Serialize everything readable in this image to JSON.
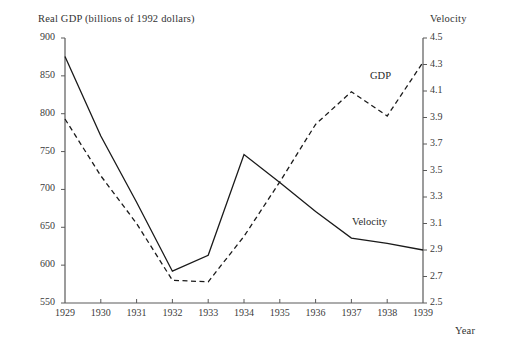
{
  "chart_data": {
    "type": "line",
    "title": "",
    "xlabel": "Year",
    "left_axis": {
      "label": "Real GDP (billions of 1992 dollars)",
      "ticks": [
        550,
        600,
        650,
        700,
        750,
        800,
        850,
        900
      ],
      "ylim": [
        550,
        900
      ]
    },
    "right_axis": {
      "label": "Velocity",
      "ticks": [
        2.5,
        2.7,
        2.9,
        3.1,
        3.3,
        3.5,
        3.7,
        3.9,
        4.1,
        4.3,
        4.5
      ],
      "ylim": [
        2.5,
        4.5
      ]
    },
    "x": [
      1929,
      1930,
      1931,
      1932,
      1933,
      1934,
      1935,
      1936,
      1937,
      1938,
      1939
    ],
    "xtick_labels": [
      "1929",
      "1930",
      "1931",
      "1932",
      "1933",
      "1934",
      "1935",
      "1936",
      "1937",
      "1938",
      "1939"
    ],
    "grid": false,
    "legend_position": "inline-annotation",
    "series": [
      {
        "name": "GDP",
        "axis": "left",
        "style": "dashed",
        "color": "#1a1a1a",
        "annotation": "GDP",
        "values": [
          793,
          718,
          655,
          580,
          578,
          638,
          710,
          786,
          829,
          797,
          868
        ]
      },
      {
        "name": "Velocity",
        "axis": "right",
        "style": "solid",
        "color": "#1a1a1a",
        "annotation": "Velocity",
        "values": [
          4.36,
          3.76,
          3.26,
          2.74,
          2.86,
          3.62,
          3.41,
          3.19,
          2.99,
          2.95,
          2.9
        ]
      }
    ]
  },
  "axis_styling": {
    "axis_color": "#5a5a5a",
    "tick_color": "#5a5a5a"
  }
}
